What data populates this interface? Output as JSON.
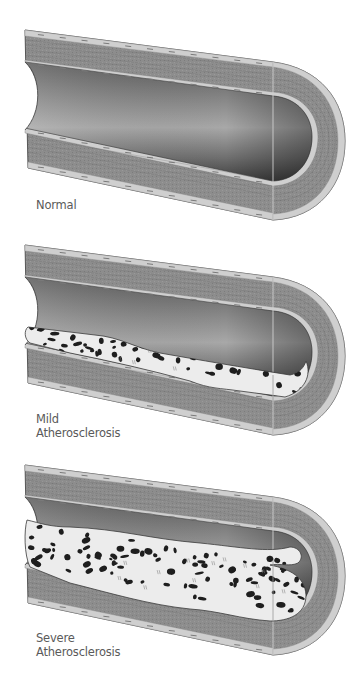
{
  "diagram": {
    "type": "medical-illustration",
    "colors": {
      "background": "#ffffff",
      "wall": "#8a8a8a",
      "wall_dark": "#6e6e6e",
      "intima_band": "#cfcfcf",
      "lumen_light": "#b0b0b0",
      "lumen_dark": "#4a4a4a",
      "plaque": "#ececec",
      "plaque_spots": "#1e1e1e",
      "outline": "#3a3a3a",
      "label_text": "#5a5a5a"
    },
    "panels": [
      {
        "id": "normal",
        "label_lines": [
          "Normal"
        ],
        "plaque_level": 0
      },
      {
        "id": "mild",
        "label_lines": [
          "Mild",
          "Atherosclerosis"
        ],
        "plaque_level": 1
      },
      {
        "id": "severe",
        "label_lines": [
          "Severe",
          "Atherosclerosis"
        ],
        "plaque_level": 2
      }
    ]
  }
}
